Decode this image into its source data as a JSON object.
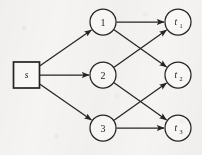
{
  "figure": {
    "kind": "directed-flow-network",
    "background_color": "#f5f4f2",
    "ink_color": "#262422",
    "width": 202,
    "height": 155
  },
  "nodes": {
    "source": {
      "id": "s",
      "label": "s",
      "subscript": "",
      "shape": "square",
      "cx": 26.5,
      "cy": 75,
      "size": 26
    },
    "middle": [
      {
        "id": "n1",
        "label": "1",
        "subscript": "",
        "shape": "circle",
        "cx": 103,
        "cy": 22,
        "r": 13
      },
      {
        "id": "n2",
        "label": "2",
        "subscript": "",
        "shape": "circle",
        "cx": 103,
        "cy": 75,
        "r": 13
      },
      {
        "id": "n3",
        "label": "3",
        "subscript": "",
        "shape": "circle",
        "cx": 103,
        "cy": 128,
        "r": 13
      }
    ],
    "targets": [
      {
        "id": "t1",
        "label": "t",
        "subscript": "1",
        "shape": "circle",
        "cx": 178,
        "cy": 22,
        "r": 13
      },
      {
        "id": "t2",
        "label": "t",
        "subscript": "2",
        "shape": "circle",
        "cx": 178,
        "cy": 75,
        "r": 13
      },
      {
        "id": "t3",
        "label": "t",
        "subscript": "3",
        "shape": "circle",
        "cx": 178,
        "cy": 128,
        "r": 13
      }
    ]
  },
  "edges": [
    {
      "id": "e-s-1",
      "from": "s",
      "to": "n1",
      "directed": true
    },
    {
      "id": "e-s-2",
      "from": "s",
      "to": "n2",
      "directed": true
    },
    {
      "id": "e-s-3",
      "from": "s",
      "to": "n3",
      "directed": true
    },
    {
      "id": "e-1-t1",
      "from": "n1",
      "to": "t1",
      "directed": true
    },
    {
      "id": "e-1-t2",
      "from": "n1",
      "to": "t2",
      "directed": true
    },
    {
      "id": "e-2-t1",
      "from": "n2",
      "to": "t1",
      "directed": true
    },
    {
      "id": "e-2-t3",
      "from": "n2",
      "to": "t3",
      "directed": true
    },
    {
      "id": "e-3-t2",
      "from": "n3",
      "to": "t2",
      "directed": true
    },
    {
      "id": "e-3-t3",
      "from": "n3",
      "to": "t3",
      "directed": true
    }
  ]
}
